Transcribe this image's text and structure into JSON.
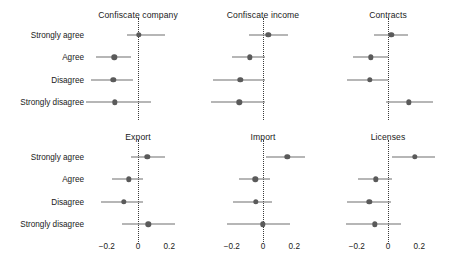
{
  "chart_data": {
    "type": "scatter",
    "title": "",
    "xlabel": "",
    "ylabel": "",
    "xlim": [
      -0.32,
      0.32
    ],
    "xticks": [
      -0.2,
      0,
      0.2
    ],
    "xticklabels": [
      "−0.2",
      "0",
      "0.2"
    ],
    "categories": [
      "Strongly agree",
      "Agree",
      "Disagree",
      "Strongly disagree"
    ],
    "grid": false,
    "legend": null,
    "zero_reference_line": 0,
    "marker": "point-estimate-with-confidence-interval",
    "panels": [
      {
        "title": "Confiscate company",
        "row": 0,
        "col": 0,
        "points": [
          {
            "category": "Strongly agree",
            "estimate": 0.005,
            "ci_low": -0.07,
            "ci_high": 0.175
          },
          {
            "category": "Agree",
            "estimate": -0.152,
            "ci_low": -0.27,
            "ci_high": -0.045
          },
          {
            "category": "Disagree",
            "estimate": -0.158,
            "ci_low": -0.3,
            "ci_high": -0.03
          },
          {
            "category": "Strongly disagree",
            "estimate": -0.147,
            "ci_low": -0.33,
            "ci_high": 0.08
          }
        ]
      },
      {
        "title": "Confiscate income",
        "row": 0,
        "col": 1,
        "points": [
          {
            "category": "Strongly agree",
            "estimate": 0.035,
            "ci_low": -0.09,
            "ci_high": 0.16
          },
          {
            "category": "Agree",
            "estimate": -0.085,
            "ci_low": -0.2,
            "ci_high": 0.01
          },
          {
            "category": "Disagree",
            "estimate": -0.145,
            "ci_low": -0.32,
            "ci_high": 0.01
          },
          {
            "category": "Strongly disagree",
            "estimate": -0.152,
            "ci_low": -0.33,
            "ci_high": 0.015
          }
        ]
      },
      {
        "title": "Contracts",
        "row": 0,
        "col": 2,
        "points": [
          {
            "category": "Strongly agree",
            "estimate": 0.02,
            "ci_low": -0.09,
            "ci_high": 0.125
          },
          {
            "category": "Agree",
            "estimate": -0.11,
            "ci_low": -0.225,
            "ci_high": 0.0
          },
          {
            "category": "Disagree",
            "estimate": -0.115,
            "ci_low": -0.265,
            "ci_high": 0.0
          },
          {
            "category": "Strongly disagree",
            "estimate": 0.135,
            "ci_low": -0.01,
            "ci_high": 0.285
          }
        ]
      },
      {
        "title": "Export",
        "row": 1,
        "col": 0,
        "points": [
          {
            "category": "Strongly agree",
            "estimate": 0.06,
            "ci_low": -0.045,
            "ci_high": 0.175
          },
          {
            "category": "Agree",
            "estimate": -0.06,
            "ci_low": -0.165,
            "ci_high": 0.035
          },
          {
            "category": "Disagree",
            "estimate": -0.09,
            "ci_low": -0.235,
            "ci_high": 0.035
          },
          {
            "category": "Strongly disagree",
            "estimate": 0.065,
            "ci_low": -0.105,
            "ci_high": 0.235
          }
        ]
      },
      {
        "title": "Import",
        "row": 1,
        "col": 1,
        "points": [
          {
            "category": "Strongly agree",
            "estimate": 0.155,
            "ci_low": 0.02,
            "ci_high": 0.27
          },
          {
            "category": "Agree",
            "estimate": -0.05,
            "ci_low": -0.155,
            "ci_high": 0.045
          },
          {
            "category": "Disagree",
            "estimate": -0.045,
            "ci_low": -0.195,
            "ci_high": 0.055
          },
          {
            "category": "Strongly disagree",
            "estimate": 0.0,
            "ci_low": -0.23,
            "ci_high": 0.175
          }
        ]
      },
      {
        "title": "Licenses",
        "row": 1,
        "col": 2,
        "points": [
          {
            "category": "Strongly agree",
            "estimate": 0.17,
            "ci_low": 0.025,
            "ci_high": 0.3
          },
          {
            "category": "Agree",
            "estimate": -0.08,
            "ci_low": -0.19,
            "ci_high": 0.025
          },
          {
            "category": "Disagree",
            "estimate": -0.12,
            "ci_low": -0.265,
            "ci_high": 0.02
          },
          {
            "category": "Strongly disagree",
            "estimate": -0.085,
            "ci_low": -0.27,
            "ci_high": 0.08
          }
        ]
      }
    ],
    "colors": {
      "marker": "#5a5a5a",
      "ci": "#6e6e6e",
      "zero_line": "#3a3a3a",
      "text": "#1a1a1a",
      "background": "#ffffff"
    }
  }
}
